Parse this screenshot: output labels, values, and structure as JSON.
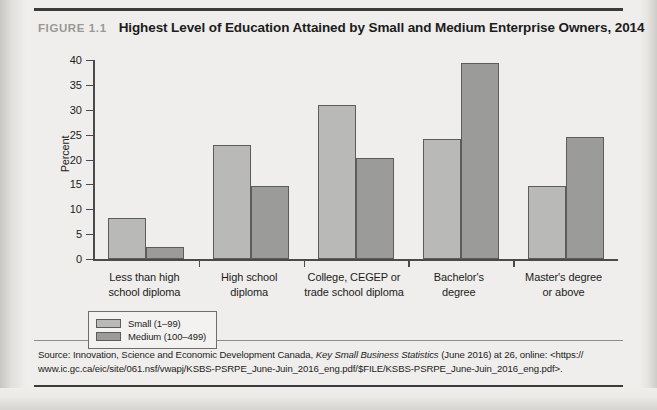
{
  "figure": {
    "number_label": "FIGURE 1.1",
    "title": "Highest Level of Education Attained by Small and Medium Enterprise Owners, 2014"
  },
  "chart_data": {
    "type": "bar",
    "title": "Highest Level of Education Attained by Small and Medium Enterprise Owners, 2014",
    "xlabel": "",
    "ylabel": "Percent",
    "ylim": [
      0,
      40
    ],
    "yticks": [
      0,
      5,
      10,
      15,
      20,
      25,
      30,
      35,
      40
    ],
    "ytick_labels": [
      "0",
      "5",
      "10",
      "15",
      "20",
      "25",
      "30",
      "35",
      "40"
    ],
    "grid": false,
    "legend_position": "below-left",
    "categories": [
      "Less than high school diploma",
      "High school diploma",
      "College, CEGEP or trade school diploma",
      "Bachelor's degree",
      "Master's degree or above"
    ],
    "category_lines": [
      [
        "Less than high",
        "school diploma"
      ],
      [
        "High school",
        "diploma"
      ],
      [
        "College, CEGEP or",
        "trade school diploma"
      ],
      [
        "Bachelor's",
        "degree"
      ],
      [
        "Master's degree",
        "or above"
      ]
    ],
    "series": [
      {
        "name": "Small (1–99)",
        "color": "#b9b9b7",
        "values": [
          8.3,
          23.0,
          30.9,
          24.1,
          14.6
        ]
      },
      {
        "name": "Medium (100–499)",
        "color": "#9b9b99",
        "values": [
          2.5,
          14.6,
          20.3,
          39.5,
          24.5
        ]
      }
    ]
  },
  "legend": {
    "items": [
      {
        "label": "Small (1–99)",
        "color": "#b9b9b7"
      },
      {
        "label": "Medium (100–499)",
        "color": "#9b9b99"
      }
    ]
  },
  "source": {
    "prefix": "Source: Innovation, Science and Economic Development Canada, ",
    "italic_title": "Key Small Business Statistics",
    "middle": " (June 2016) at 26, online: <https://",
    "url_line": "www.ic.gc.ca/eic/site/061.nsf/vwapj/KSBS-PSRPE_June-Juin_2016_eng.pdf/$FILE/KSBS-PSRPE_June-Juin_2016_eng.pdf>."
  },
  "colors": {
    "page_background": "#efeeec",
    "axis": "#4a4a4a",
    "text": "#1c1c1c",
    "figure_number": "#9a9894",
    "bar_border": "#5c5c5c"
  }
}
